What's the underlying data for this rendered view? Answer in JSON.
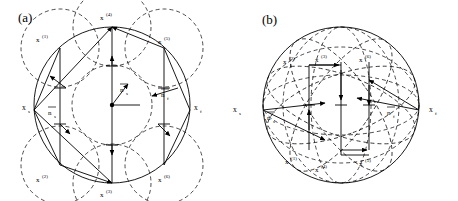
{
  "figure": {
    "background": "#ffffff",
    "stroke_color": "#000000",
    "width": 458,
    "height": 201
  },
  "panels": [
    {
      "id": "a",
      "label": "(a)",
      "label_x": 18,
      "label_y": 10,
      "center": {
        "x": 112,
        "y": 105
      },
      "radius": 78,
      "inner_radius": 40,
      "axis_labels": {
        "left": {
          "base": "x",
          "sub": "s",
          "x": 22,
          "y": 108
        },
        "right": {
          "base": "x",
          "sub": "f",
          "x": 196,
          "y": 108
        }
      },
      "vector_labels": [
        {
          "base": "n",
          "sub": "s",
          "overline": true,
          "x": 50,
          "y": 113
        },
        {
          "base": "n",
          "sub": "f",
          "overline": true,
          "x": 163,
          "y": 95
        },
        {
          "base": "n",
          "sub": "s",
          "overline": true,
          "x": 122,
          "y": 90
        }
      ],
      "points": [
        {
          "base": "x",
          "sup": "(1)",
          "label_x": 42,
          "label_y": 38,
          "px": 60,
          "py": 48
        },
        {
          "base": "x",
          "sup": "(2)",
          "label_x": 42,
          "label_y": 178,
          "px": 60,
          "py": 165
        },
        {
          "base": "x",
          "sup": "(3)",
          "label_x": 104,
          "label_y": 193,
          "px": 112,
          "py": 183
        },
        {
          "base": "x",
          "sup": "(4)",
          "label_x": 104,
          "label_y": 16,
          "px": 112,
          "py": 27
        },
        {
          "base": "x",
          "sup": "(5)",
          "label_x": 160,
          "label_y": 40,
          "px": 164,
          "py": 48
        },
        {
          "base": "x",
          "sup": "(6)",
          "label_x": 160,
          "label_y": 178,
          "px": 164,
          "py": 165
        }
      ]
    },
    {
      "id": "b",
      "label": "(b)",
      "label_x": 33,
      "label_y": 12,
      "center": {
        "x": 112,
        "y": 105
      },
      "radius": 78,
      "axis_labels": {
        "left": {
          "base": "x",
          "sub": "s",
          "x": 4,
          "y": 110
        },
        "right": {
          "base": "x",
          "sub": "f",
          "x": 202,
          "y": 110
        }
      },
      "vector_labels": [
        {
          "base": "n",
          "sub": "s",
          "overline": true,
          "x": 36,
          "y": 118
        },
        {
          "base": "n",
          "sub": "f",
          "overline": true,
          "x": 160,
          "y": 113
        }
      ],
      "points": [
        {
          "base": "x",
          "sup": "(2)",
          "label_x": 58,
          "label_y": 60,
          "px": 80,
          "py": 65
        },
        {
          "base": "x",
          "sup": "(3)",
          "label_x": 88,
          "label_y": 58,
          "px": 112,
          "py": 62
        },
        {
          "base": "x",
          "sup": "(6)",
          "label_x": 132,
          "label_y": 58,
          "px": 140,
          "py": 62
        },
        {
          "base": "x",
          "sup": "(1)",
          "label_x": 60,
          "label_y": 160,
          "px": 80,
          "py": 150
        },
        {
          "base": "x",
          "sup": "(4)",
          "label_x": 90,
          "label_y": 168,
          "px": 112,
          "py": 155
        },
        {
          "base": "x",
          "sup": "(5)",
          "label_x": 132,
          "label_y": 162,
          "px": 140,
          "py": 150
        }
      ]
    }
  ]
}
